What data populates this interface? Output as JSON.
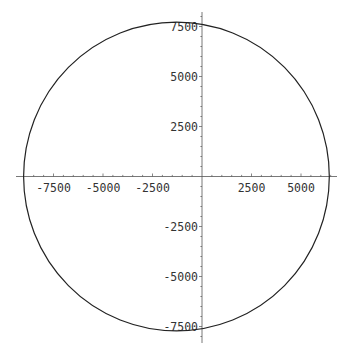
{
  "chart_data": {
    "type": "line",
    "plot_style": "parametric",
    "title": "",
    "xlabel": "",
    "ylabel": "",
    "xlim": [
      -9000,
      6800
    ],
    "ylim": [
      -8300,
      8200
    ],
    "grid": false,
    "legend": null,
    "axes_through_origin": true,
    "x_ticks": [
      -7500,
      -5000,
      -2500,
      2500,
      5000
    ],
    "x_tick_labels": [
      "-7500",
      "-5000",
      "-2500",
      "2500",
      "5000"
    ],
    "y_ticks": [
      7500,
      5000,
      2500,
      -2500,
      -5000,
      -7500
    ],
    "y_tick_labels": [
      "7500",
      "5000",
      "2500",
      "-2500",
      "-5000",
      "-7500"
    ],
    "series": [
      {
        "name": "circle",
        "shape": "circle",
        "center": [
          -1290,
          0
        ],
        "radius": 7720,
        "x": [
          6430,
          5970,
          4750,
          2570,
          -130,
          -1290,
          -5150,
          -7970,
          -9010,
          -7970,
          -5150,
          -1290,
          2570,
          5970,
          6430
        ],
        "y": [
          0,
          2950,
          5460,
          7230,
          7710,
          7720,
          6690,
          3860,
          0,
          -3860,
          -6690,
          -7720,
          -6690,
          -2950,
          0
        ]
      }
    ]
  },
  "layout": {
    "origin_px": [
      202,
      176.5
    ],
    "px_per_unit_x": 0.0198,
    "px_per_unit_y": 0.02,
    "x_axis_px": [
      16,
      337
    ],
    "y_axis_px": [
      12,
      343
    ]
  },
  "colors": {
    "curve": "#222222",
    "axis": "#555555",
    "label": "#333333",
    "background": "#ffffff"
  }
}
